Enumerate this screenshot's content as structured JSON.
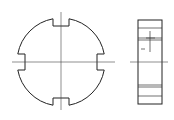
{
  "drawing": {
    "title": "Slotted round nut — front and side views",
    "views": [
      {
        "name": "front-view",
        "shape": "circle with four rectangular slots",
        "slots": 4
      },
      {
        "name": "side-view",
        "shape": "rectangle with slot section lines"
      }
    ],
    "colors": {
      "line": "#222222",
      "background": "#ffffff"
    }
  }
}
